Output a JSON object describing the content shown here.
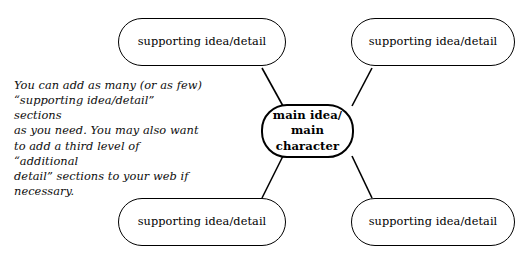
{
  "diagram": {
    "type": "concept-web",
    "title_node": {
      "label": "main idea/\nmain character"
    },
    "satellite_label": "supporting idea/detail",
    "nodes": [
      {
        "id": "top-left",
        "label": "supporting idea/detail"
      },
      {
        "id": "top-right",
        "label": "supporting idea/detail"
      },
      {
        "id": "bottom-left",
        "label": "supporting idea/detail"
      },
      {
        "id": "bottom-right",
        "label": "supporting idea/detail"
      }
    ],
    "caption": "You can add as many (or as few)\n“supporting idea/detail” sections\nas you need. You may also want\nto add a third level of “additional\ndetail” sections to your web if\nnecessary.",
    "colors": {
      "stroke": "#000000",
      "background": "#ffffff",
      "text": "#000000"
    }
  }
}
